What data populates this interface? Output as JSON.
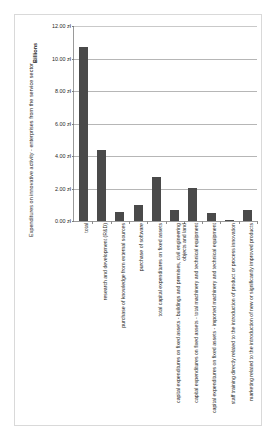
{
  "chart_data": {
    "type": "bar",
    "title": "",
    "ylabel": "Expenditures on innovative activity - enterprises from the service sector",
    "y_scale_label": "Billions",
    "xlabel": "",
    "ylim": [
      0,
      12
    ],
    "grid": true,
    "legend": "none",
    "currency_suffix": "zł",
    "y_ticks": [
      {
        "value": 12,
        "label": "12.00 zł"
      },
      {
        "value": 10,
        "label": "10.00 zł"
      },
      {
        "value": 8,
        "label": "8.00 zł"
      },
      {
        "value": 6,
        "label": "6.00 zł"
      },
      {
        "value": 4,
        "label": "4.00 zł"
      },
      {
        "value": 2,
        "label": "2.00 zł"
      },
      {
        "value": 0,
        "label": "0.00 zł"
      }
    ],
    "categories": [
      "total",
      "research and development (R&D)",
      "purchase of knowledge from external sources",
      "purchase of software",
      "total capital expenditures on fixed assets",
      "capital expenditures on fixed assets - buildings and premises, civil engineering objects and land",
      "capital expenditures on fixed assets - total machinery and technical equipment",
      "capital expenditures on fixed assets - imported machinery and technical equipment",
      "staff training directly related to the introduction of product or process innovation",
      "marketing related to the introduction of new or significantly improved products"
    ],
    "values": [
      10.7,
      4.35,
      0.55,
      1.0,
      2.7,
      0.65,
      2.05,
      0.5,
      0.05,
      0.7
    ],
    "series": [
      {
        "name": "Expenditures",
        "color": "#4a4a4a",
        "values": [
          10.7,
          4.35,
          0.55,
          1.0,
          2.7,
          0.65,
          2.05,
          0.5,
          0.05,
          0.7
        ]
      }
    ]
  },
  "colors": {
    "bar": "#4a4a4a",
    "gridline": "#b6b6b6",
    "axis": "#9a9a9a",
    "frame": "#d9d9d9",
    "background": "#ffffff",
    "text": "#1f1f1f"
  }
}
